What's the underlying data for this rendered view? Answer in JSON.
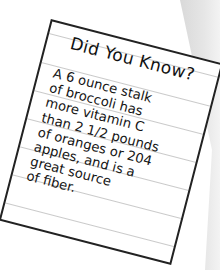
{
  "colors": {
    "background": "#ffffff",
    "band": "#e4e4e4",
    "card_border": "#222222",
    "rule_line": "#c9c9c9",
    "text": "#151515"
  },
  "card": {
    "title": "Did You Know?",
    "lines": [
      "A 6 ounce stalk",
      "of broccoli has",
      "more vitamin C",
      "than 2 1/2 pounds",
      "of oranges or 204",
      "apples, and is a",
      "great source",
      "of fiber."
    ]
  }
}
